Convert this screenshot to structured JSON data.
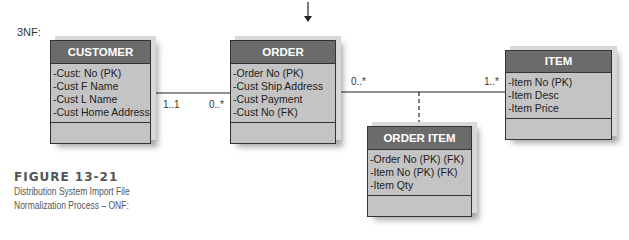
{
  "diagram": {
    "normal_form_label": "3NF:",
    "entities": [
      {
        "name": "CUSTOMER",
        "attributes": [
          "-Cust: No (PK)",
          "-Cust F Name",
          "-Cust L Name",
          "-Cust Home Address"
        ]
      },
      {
        "name": "ORDER",
        "attributes": [
          "-Order No (PK)",
          "-Cust Ship Address",
          "-Cust Payment",
          "-Cust No (FK)"
        ]
      },
      {
        "name": "ITEM",
        "attributes": [
          "-Item No (PK)",
          "-Item Desc",
          "-Item Price"
        ]
      },
      {
        "name": "ORDER ITEM",
        "attributes": [
          "-Order No (PK) (FK)",
          "-Item No (PK) (FK)",
          "-Item Qty"
        ]
      }
    ],
    "relationships": [
      {
        "from": "CUSTOMER",
        "to": "ORDER",
        "from_multiplicity": "1..1",
        "to_multiplicity": "0..*"
      },
      {
        "from": "ORDER",
        "to": "ITEM",
        "from_multiplicity": "0..*",
        "to_multiplicity": "1..*",
        "association_class": "ORDER ITEM"
      }
    ]
  },
  "caption": {
    "figure": "FIGURE 13-21",
    "line1": "Distribution System Import File",
    "line2": "Normalization Process – ONF:"
  },
  "colors": {
    "header": "#6b6b6b",
    "body": "#c4c4c4",
    "border": "#333333"
  }
}
